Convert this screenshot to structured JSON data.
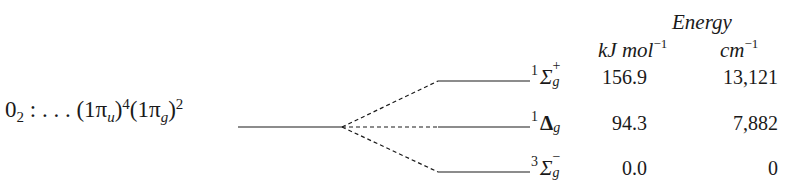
{
  "header": {
    "title": "Energy",
    "unit_kj": "kJ mol",
    "unit_kj_exp": "−1",
    "unit_cm": "cm",
    "unit_cm_exp": "−1"
  },
  "configuration": {
    "molecule": "0",
    "molecule_sub": "2",
    "separator": " : . . . ",
    "orbital1": "(1π",
    "orbital1_sub": "u",
    "orbital1_close": ")",
    "orbital1_exp": "4",
    "orbital2": "(1π",
    "orbital2_sub": "g",
    "orbital2_close": ")",
    "orbital2_exp": "2"
  },
  "states": [
    {
      "multiplicity": "1",
      "symbol": "Σ",
      "parity": "g",
      "reflection": "+",
      "energy_kj": "156.9",
      "energy_cm": "13,121"
    },
    {
      "multiplicity": "1",
      "symbol": "Δ",
      "parity": "g",
      "reflection": "",
      "energy_kj": "94.3",
      "energy_cm": "7,882"
    },
    {
      "multiplicity": "3",
      "symbol": "Σ",
      "parity": "g",
      "reflection": "−",
      "energy_kj": "0.0",
      "energy_cm": "0"
    }
  ],
  "colors": {
    "ink": "#1a1a1a"
  }
}
